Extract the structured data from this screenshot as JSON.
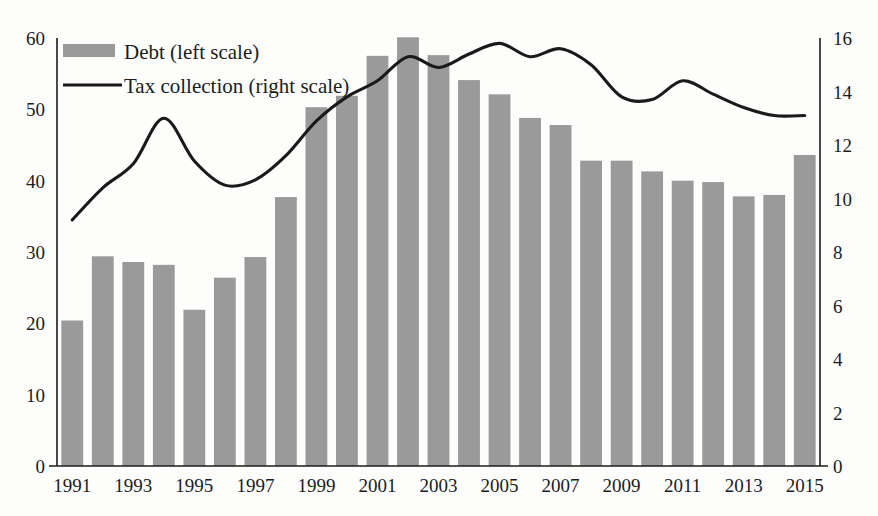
{
  "chart_data": {
    "type": "bar",
    "title": "",
    "subtitle": "",
    "xlabel": "",
    "ylabel": "",
    "grid": false,
    "legend_position": "top-left",
    "x": [
      1991,
      1992,
      1993,
      1994,
      1995,
      1996,
      1997,
      1998,
      1999,
      2000,
      2001,
      2002,
      2003,
      2004,
      2005,
      2006,
      2007,
      2008,
      2009,
      2010,
      2011,
      2012,
      2013,
      2014,
      2015
    ],
    "categories": [
      "1991",
      "1992",
      "1993",
      "1994",
      "1995",
      "1996",
      "1997",
      "1998",
      "1999",
      "2000",
      "2001",
      "2002",
      "2003",
      "2004",
      "2005",
      "2006",
      "2007",
      "2008",
      "2009",
      "2010",
      "2011",
      "2012",
      "2013",
      "2014",
      "2015"
    ],
    "xtick_labels": [
      "1991",
      "1993",
      "1995",
      "1997",
      "1999",
      "2001",
      "2003",
      "2005",
      "2007",
      "2009",
      "2011",
      "2013",
      "2015"
    ],
    "xtick_values": [
      1991,
      1993,
      1995,
      1997,
      1999,
      2001,
      2003,
      2005,
      2007,
      2009,
      2011,
      2013,
      2015
    ],
    "series": [
      {
        "name": "Debt (left scale)",
        "type": "bar",
        "axis": "left",
        "color": "#9a9a9a",
        "values": [
          20.4,
          29.4,
          28.6,
          28.2,
          21.9,
          26.4,
          29.3,
          37.7,
          50.3,
          51.9,
          57.5,
          60.1,
          57.6,
          54.1,
          52.1,
          48.8,
          47.8,
          42.8,
          42.8,
          41.3,
          40.0,
          39.8,
          37.8,
          38.0,
          43.6
        ]
      },
      {
        "name": "Tax collection (right scale)",
        "type": "line",
        "axis": "right",
        "color": "#1a1a1a",
        "values": [
          9.2,
          10.4,
          11.3,
          13.0,
          11.4,
          10.5,
          10.7,
          11.6,
          12.9,
          13.8,
          14.4,
          15.3,
          14.9,
          15.4,
          15.8,
          15.3,
          15.6,
          15.0,
          13.8,
          13.7,
          14.4,
          13.9,
          13.4,
          13.1,
          13.1
        ]
      }
    ],
    "left_axis": {
      "label": "",
      "ticks": [
        0,
        10,
        20,
        30,
        40,
        50,
        60
      ],
      "ylim": [
        0,
        60
      ]
    },
    "right_axis": {
      "label": "",
      "ticks": [
        0,
        2,
        4,
        6,
        8,
        10,
        12,
        14,
        16
      ],
      "ylim": [
        0,
        16
      ]
    },
    "legend": [
      {
        "label": "Debt (left scale)",
        "marker": "bar-swatch",
        "color": "#9a9a9a"
      },
      {
        "label": "Tax collection (right scale)",
        "marker": "line",
        "color": "#1a1a1a"
      }
    ]
  }
}
